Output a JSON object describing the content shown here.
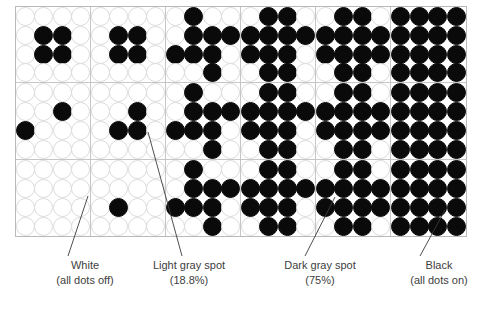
{
  "figure": {
    "name": "halftone-dot-density-diagram",
    "dot_on_color": "#0a0a0a",
    "dot_off_color": "#ffffff",
    "grid_line_color": "#c6c6c6",
    "columns": 6,
    "rows": 3,
    "dots_per_cell_x": 4,
    "dots_per_cell_y": 4
  },
  "chart_data": {
    "type": "heatmap",
    "title": "",
    "xlabel": "",
    "ylabel": "",
    "categories": [
      "White",
      "Light gray spot",
      "Mid gray",
      "Mid-dark gray",
      "Dark gray spot",
      "Black"
    ],
    "values": [
      0,
      18.8,
      25,
      50,
      75,
      100
    ],
    "unit": "%",
    "cells": [
      [
        [
          [
            0,
            0,
            0,
            0
          ],
          [
            0,
            1,
            1,
            0
          ],
          [
            0,
            1,
            1,
            0
          ],
          [
            0,
            0,
            0,
            0
          ]
        ],
        [
          [
            0,
            0,
            0,
            0
          ],
          [
            0,
            1,
            1,
            0
          ],
          [
            0,
            1,
            1,
            0
          ],
          [
            0,
            0,
            0,
            0
          ]
        ],
        [
          [
            0,
            1,
            0,
            0
          ],
          [
            0,
            1,
            1,
            1
          ],
          [
            1,
            1,
            1,
            0
          ],
          [
            0,
            0,
            1,
            0
          ]
        ],
        [
          [
            0,
            1,
            1,
            0
          ],
          [
            1,
            1,
            1,
            1
          ],
          [
            1,
            1,
            1,
            0
          ],
          [
            0,
            1,
            1,
            0
          ]
        ],
        [
          [
            0,
            1,
            1,
            0
          ],
          [
            1,
            1,
            1,
            1
          ],
          [
            1,
            1,
            1,
            1
          ],
          [
            0,
            1,
            1,
            0
          ]
        ],
        [
          [
            1,
            1,
            1,
            1
          ],
          [
            1,
            1,
            1,
            1
          ],
          [
            1,
            1,
            1,
            1
          ],
          [
            1,
            1,
            1,
            1
          ]
        ]
      ],
      [
        [
          [
            0,
            0,
            0,
            0
          ],
          [
            0,
            0,
            1,
            0
          ],
          [
            1,
            0,
            0,
            0
          ],
          [
            0,
            0,
            0,
            0
          ]
        ],
        [
          [
            0,
            0,
            0,
            0
          ],
          [
            0,
            0,
            1,
            0
          ],
          [
            0,
            1,
            1,
            0
          ],
          [
            0,
            0,
            0,
            0
          ]
        ],
        [
          [
            0,
            1,
            0,
            0
          ],
          [
            0,
            1,
            1,
            1
          ],
          [
            1,
            1,
            1,
            0
          ],
          [
            0,
            0,
            1,
            0
          ]
        ],
        [
          [
            0,
            1,
            1,
            0
          ],
          [
            1,
            1,
            1,
            1
          ],
          [
            1,
            1,
            1,
            0
          ],
          [
            0,
            1,
            1,
            0
          ]
        ],
        [
          [
            0,
            1,
            1,
            0
          ],
          [
            1,
            1,
            1,
            1
          ],
          [
            1,
            1,
            1,
            1
          ],
          [
            0,
            1,
            1,
            0
          ]
        ],
        [
          [
            1,
            1,
            1,
            1
          ],
          [
            1,
            1,
            1,
            1
          ],
          [
            1,
            1,
            1,
            1
          ],
          [
            1,
            1,
            1,
            1
          ]
        ]
      ],
      [
        [
          [
            0,
            0,
            0,
            0
          ],
          [
            0,
            0,
            0,
            0
          ],
          [
            0,
            0,
            0,
            0
          ],
          [
            0,
            0,
            0,
            0
          ]
        ],
        [
          [
            0,
            0,
            0,
            0
          ],
          [
            0,
            0,
            0,
            0
          ],
          [
            0,
            1,
            0,
            0
          ],
          [
            0,
            0,
            0,
            0
          ]
        ],
        [
          [
            0,
            1,
            0,
            0
          ],
          [
            0,
            1,
            1,
            1
          ],
          [
            1,
            1,
            1,
            0
          ],
          [
            0,
            0,
            1,
            0
          ]
        ],
        [
          [
            0,
            1,
            1,
            0
          ],
          [
            1,
            1,
            1,
            1
          ],
          [
            1,
            1,
            1,
            0
          ],
          [
            0,
            1,
            1,
            0
          ]
        ],
        [
          [
            0,
            1,
            1,
            0
          ],
          [
            1,
            1,
            1,
            1
          ],
          [
            1,
            1,
            1,
            1
          ],
          [
            0,
            1,
            1,
            0
          ]
        ],
        [
          [
            1,
            1,
            1,
            1
          ],
          [
            1,
            1,
            1,
            1
          ],
          [
            1,
            1,
            1,
            1
          ],
          [
            1,
            1,
            1,
            1
          ]
        ]
      ]
    ]
  },
  "captions": [
    {
      "name": "caption-white",
      "line1": "White",
      "line2": "(all dots off)",
      "x": 20,
      "leader": {
        "x1": 68,
        "y1": 256,
        "x2": 88,
        "y2": 196
      }
    },
    {
      "name": "caption-light-gray",
      "line1": "Light gray spot",
      "line2": "(18.8%)",
      "x": 124,
      "leader": {
        "x1": 182,
        "y1": 256,
        "x2": 148,
        "y2": 132
      }
    },
    {
      "name": "caption-dark-gray",
      "line1": "Dark gray spot",
      "line2": "(75%)",
      "x": 255,
      "leader": {
        "x1": 305,
        "y1": 256,
        "x2": 335,
        "y2": 197
      }
    },
    {
      "name": "caption-black",
      "line1": "Black",
      "line2": "(all dots on)",
      "x": 374,
      "leader": {
        "x1": 420,
        "y1": 256,
        "x2": 445,
        "y2": 210
      }
    }
  ]
}
